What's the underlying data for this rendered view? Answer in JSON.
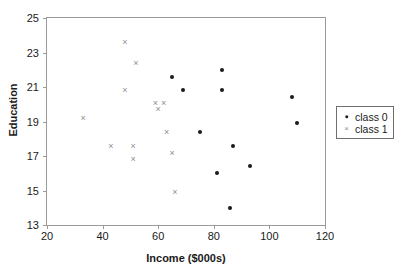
{
  "chart_data": {
    "type": "scatter",
    "title": "",
    "xlabel": "Income ($000s)",
    "ylabel": "Education",
    "xlim": [
      20,
      120
    ],
    "ylim": [
      13,
      25
    ],
    "xticks": [
      20,
      40,
      60,
      80,
      100,
      120
    ],
    "yticks": [
      13,
      15,
      17,
      19,
      21,
      23,
      25
    ],
    "grid": false,
    "legend_position": "right",
    "series": [
      {
        "name": "class 0",
        "marker": "filled-circle",
        "color": "#1a1a1a",
        "points": [
          {
            "x": 65,
            "y": 21.6
          },
          {
            "x": 83,
            "y": 22.0
          },
          {
            "x": 69,
            "y": 20.8
          },
          {
            "x": 83,
            "y": 20.8
          },
          {
            "x": 108,
            "y": 20.4
          },
          {
            "x": 110,
            "y": 18.9
          },
          {
            "x": 75,
            "y": 18.4
          },
          {
            "x": 87,
            "y": 17.6
          },
          {
            "x": 93,
            "y": 16.4
          },
          {
            "x": 81,
            "y": 16.0
          },
          {
            "x": 86,
            "y": 14.0
          }
        ]
      },
      {
        "name": "class 1",
        "marker": "cross",
        "color": "#8e8e8e",
        "points": [
          {
            "x": 48,
            "y": 23.6
          },
          {
            "x": 52,
            "y": 22.4
          },
          {
            "x": 48,
            "y": 20.8
          },
          {
            "x": 59,
            "y": 20.1
          },
          {
            "x": 62,
            "y": 20.1
          },
          {
            "x": 60,
            "y": 19.7
          },
          {
            "x": 33,
            "y": 19.2
          },
          {
            "x": 63,
            "y": 18.4
          },
          {
            "x": 43,
            "y": 17.6
          },
          {
            "x": 51,
            "y": 17.6
          },
          {
            "x": 65,
            "y": 17.2
          },
          {
            "x": 51,
            "y": 16.8
          },
          {
            "x": 66,
            "y": 14.9
          }
        ]
      }
    ]
  },
  "legend": {
    "entries": [
      {
        "label": "class 0",
        "marker": "filled-circle"
      },
      {
        "label": "class 1",
        "marker": "cross"
      }
    ]
  },
  "colors": {
    "class_0": "#1a1a1a",
    "class_1": "#8e8e8e",
    "frame": "#9a9a9a",
    "legend_border": "#6e6e6e",
    "background": "#ffffff"
  }
}
